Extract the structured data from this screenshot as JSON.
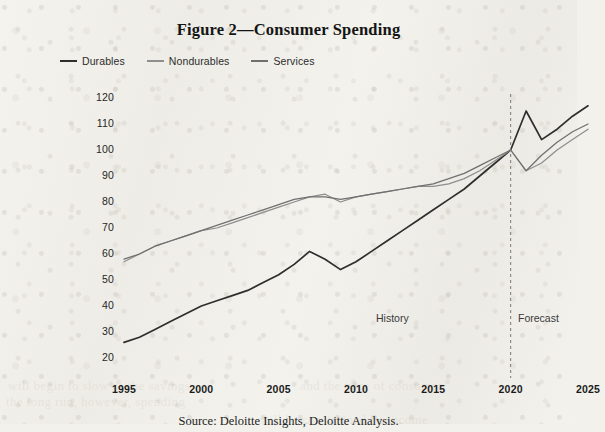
{
  "figure": {
    "title": "Figure 2—Consumer Spending",
    "source": "Source: Deloitte Insights, Deloitte Analysis."
  },
  "annotations": {
    "history": "History",
    "forecast": "Forecast",
    "divider_year": 2020
  },
  "colors": {
    "durables": "#2e2e2e",
    "nondurables": "#8e8e8e",
    "services": "#6f6f6f",
    "paper": "#f2f1ec",
    "text": "#222222"
  },
  "bleedthrough": [
    "will begin to slow as the savings",
    "the long run, however, spending",
    "and the pace of consumer",
    "will be constrained by income"
  ],
  "chart_data": {
    "type": "line",
    "title": "Figure 2—Consumer Spending",
    "subtitle": "",
    "xlabel": "",
    "ylabel": "",
    "xlim": [
      1995,
      2025
    ],
    "ylim": [
      20,
      120
    ],
    "xticks": [
      1995,
      2000,
      2005,
      2010,
      2015,
      2020,
      2025
    ],
    "yticks": [
      20,
      30,
      40,
      50,
      60,
      70,
      80,
      90,
      100,
      110,
      120
    ],
    "grid": false,
    "legend_position": "top-left",
    "x": [
      1995,
      1996,
      1997,
      1998,
      1999,
      2000,
      2001,
      2002,
      2003,
      2004,
      2005,
      2006,
      2007,
      2008,
      2009,
      2010,
      2011,
      2012,
      2013,
      2014,
      2015,
      2016,
      2017,
      2018,
      2019,
      2020,
      2021,
      2022,
      2023,
      2024,
      2025
    ],
    "series": [
      {
        "name": "Durables",
        "color": "#2e2e2e",
        "values": [
          26,
          28,
          31,
          34,
          37,
          40,
          42,
          44,
          46,
          49,
          52,
          56,
          61,
          58,
          54,
          57,
          61,
          65,
          69,
          73,
          77,
          81,
          85,
          90,
          95,
          100,
          115,
          104,
          108,
          113,
          117
        ]
      },
      {
        "name": "Nondurables",
        "color": "#8e8e8e",
        "values": [
          57,
          60,
          63,
          65,
          67,
          69,
          70,
          72,
          74,
          76,
          78,
          80,
          82,
          83,
          80,
          82,
          83,
          84,
          85,
          86,
          86,
          87,
          89,
          92,
          96,
          100,
          92,
          95,
          100,
          104,
          108
        ]
      },
      {
        "name": "Services",
        "color": "#6f6f6f",
        "values": [
          58,
          60,
          63,
          65,
          67,
          69,
          71,
          73,
          75,
          77,
          79,
          81,
          82,
          82,
          81,
          82,
          83,
          84,
          85,
          86,
          87,
          89,
          91,
          94,
          97,
          100,
          92,
          98,
          103,
          107,
          110
        ]
      }
    ]
  }
}
